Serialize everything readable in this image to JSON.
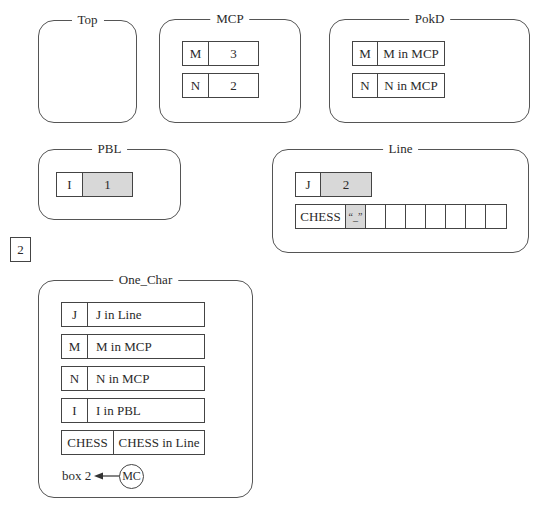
{
  "frames": {
    "top": {
      "title": "Top"
    },
    "mcp": {
      "title": "MCP",
      "rows": [
        {
          "name": "M",
          "value": "3"
        },
        {
          "name": "N",
          "value": "2"
        }
      ]
    },
    "pokd": {
      "title": "PokD",
      "rows": [
        {
          "name": "M",
          "value": "M in MCP"
        },
        {
          "name": "N",
          "value": "N in MCP"
        }
      ]
    },
    "pbl": {
      "title": "PBL",
      "rows": [
        {
          "name": "I",
          "value": "1"
        }
      ]
    },
    "line": {
      "title": "Line",
      "j": {
        "name": "J",
        "value": "2"
      },
      "chess": {
        "name": "CHESS",
        "cells": [
          "“_”",
          "",
          "",
          "",
          "",
          "",
          "",
          ""
        ]
      }
    },
    "one_char": {
      "title": "One_Char",
      "rows": [
        {
          "name": "J",
          "value": "J in Line"
        },
        {
          "name": "M",
          "value": "M in MCP"
        },
        {
          "name": "N",
          "value": "N in MCP"
        },
        {
          "name": "I",
          "value": "I in PBL"
        },
        {
          "name": "CHESS",
          "value": "CHESS in Line"
        }
      ],
      "return_label": "box 2",
      "return_node": "MC"
    }
  },
  "standalone_box": {
    "value": "2"
  },
  "colors": {
    "border": "#444444",
    "shaded_cell": "#d8d8d8",
    "background": "#ffffff"
  }
}
